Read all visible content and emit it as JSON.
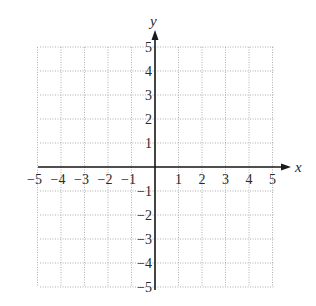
{
  "diagram": {
    "type": "coordinate-plane",
    "x_axis": {
      "label": "x",
      "min": -5,
      "max": 5,
      "ticks": [
        "-5",
        "-4",
        "-3",
        "-2",
        "-1",
        "1",
        "2",
        "3",
        "4",
        "5"
      ]
    },
    "y_axis": {
      "label": "y",
      "min": -5,
      "max": 5,
      "ticks": [
        "5",
        "4",
        "3",
        "2",
        "1",
        "-1",
        "-2",
        "-3",
        "-4",
        "-5"
      ]
    },
    "grid": {
      "style": "dotted",
      "step": 1
    },
    "colors": {
      "axis": "#1a1a1a",
      "grid": "#9a9a9a",
      "text": "#2a2a2a"
    }
  }
}
